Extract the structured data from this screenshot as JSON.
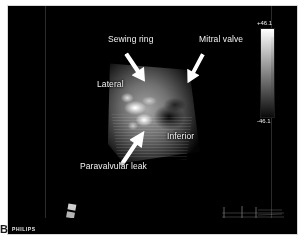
{
  "figure": {
    "panel_letter": "B",
    "vendor_mark": "PHILIPS",
    "modality": "3D transesophageal echocardiography"
  },
  "annotations": [
    {
      "id": "sewing-ring",
      "label": "Sewing ring"
    },
    {
      "id": "mitral-valve",
      "label": "Mitral valve"
    },
    {
      "id": "lateral",
      "label": "Lateral"
    },
    {
      "id": "inferior",
      "label": "Inferior"
    },
    {
      "id": "paravalvular-leak",
      "label": "Paravalvular leak"
    }
  ],
  "colorbar": {
    "top_label": "+46.1",
    "bottom_label": "-46.1",
    "type": "grayscale",
    "top_color": "#ffffff",
    "bottom_color": "#0a0a0a"
  },
  "display": {
    "background": "#000000",
    "text_color": "#f2f2f2",
    "arrow_color": "#ffffff"
  }
}
